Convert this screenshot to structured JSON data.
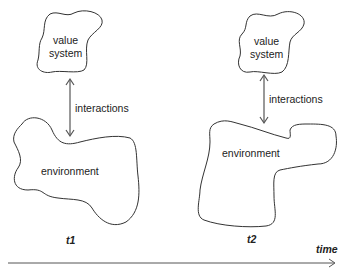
{
  "diagram": {
    "left": {
      "value_system": [
        "value",
        "system"
      ],
      "interactions": "interactions",
      "environment": "environment",
      "time_label": "t1"
    },
    "right": {
      "value_system": [
        "value",
        "system"
      ],
      "interactions": "interactions",
      "environment": "environment",
      "time_label": "t2"
    },
    "axis_label": "time"
  }
}
